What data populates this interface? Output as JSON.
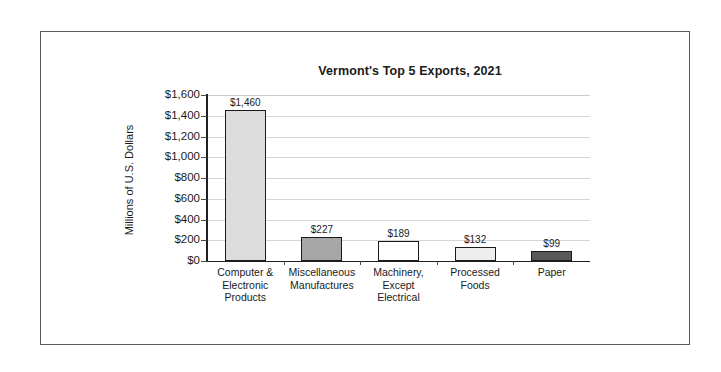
{
  "frame": {
    "border_color": "#55585c",
    "background": "#ffffff"
  },
  "chart_data": {
    "type": "bar",
    "title": "Vermont's Top 5 Exports, 2021",
    "xlabel": "",
    "ylabel": "Millions of U.S. Dollars",
    "categories": [
      "Computer & Electronic Products",
      "Miscellaneous Manufactures",
      "Machinery, Except Electrical",
      "Processed Foods",
      "Paper"
    ],
    "category_lines": [
      [
        "Computer &",
        "Electronic",
        "Products"
      ],
      [
        "Miscellaneous",
        "Manufactures"
      ],
      [
        "Machinery,",
        "Except",
        "Electrical"
      ],
      [
        "Processed",
        "Foods"
      ],
      [
        "Paper"
      ]
    ],
    "values": [
      1460,
      227,
      189,
      132,
      99
    ],
    "value_labels": [
      "$1,460",
      "$227",
      "$189",
      "$132",
      "$99"
    ],
    "bar_colors": [
      "#dcdcdc",
      "#a6a6a6",
      "#ffffff",
      "#eeeeee",
      "#595959"
    ],
    "bar_border_color": "#1a1a1a",
    "ylim": [
      0,
      1600
    ],
    "ytick_values": [
      0,
      200,
      400,
      600,
      800,
      1000,
      1200,
      1400,
      1600
    ],
    "ytick_labels": [
      "$0",
      "$200",
      "$400",
      "$600",
      "$800",
      "$1,000",
      "$1,200",
      "$1,400",
      "$1,600"
    ],
    "grid": true,
    "grid_color": "#d4d6d8",
    "legend": "none",
    "axis_color": "#1f1f1f"
  }
}
